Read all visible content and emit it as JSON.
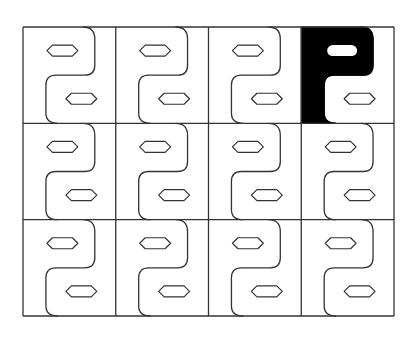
{
  "diagram": {
    "type": "tiling-pattern",
    "rows": 3,
    "cols": 4,
    "grid": {
      "x": 23,
      "y": 27,
      "width": 371,
      "height": 289
    },
    "colors": {
      "stroke": "#333333",
      "background": "#ffffff",
      "highlight": "#000000"
    },
    "highlighted_cell": {
      "row": 0,
      "col": 3
    },
    "tile": {
      "description": "S-shaped curve dividing the tile, with one rounded hexagonal slot in each half",
      "slots": 2
    }
  }
}
